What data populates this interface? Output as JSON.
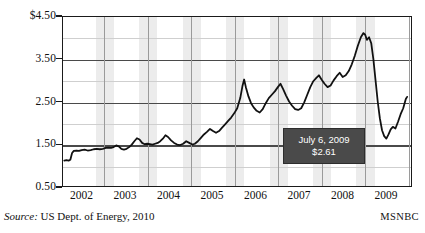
{
  "figure": {
    "source_label": "Source:",
    "source_text": " US Dept. of Energy, 2010",
    "attribution": "MSNBC"
  },
  "callout": {
    "date": "July 6, 2009",
    "value": "$2.61"
  },
  "colors": {
    "line": "#111111",
    "band": "#ececec",
    "grid_major": "#4a4a4a",
    "grid_minor": "#cfcfcf",
    "frame": "#1a1a1a",
    "callout_bg": "#4a4a4a",
    "callout_text": "#ffffff"
  },
  "chart_data": {
    "type": "line",
    "title": "",
    "subtitle": "",
    "xlabel": "",
    "ylabel": "",
    "ylim": [
      0.5,
      4.5
    ],
    "xlim": [
      2001.55,
      2009.6
    ],
    "grid": true,
    "legend": null,
    "y_ticks": [
      "0.50",
      "1.50",
      "2.50",
      "3.50",
      "$4.50"
    ],
    "y_tick_values": [
      0.5,
      1.5,
      2.5,
      3.5,
      4.5
    ],
    "y_minor_gridlines": [
      1.0,
      2.0,
      3.0,
      4.0
    ],
    "x_ticks": [
      "2002",
      "2003",
      "2004",
      "2005",
      "2006",
      "2007",
      "2008",
      "2009"
    ],
    "x_tick_values": [
      2002,
      2003,
      2004,
      2005,
      2006,
      2007,
      2008,
      2009
    ],
    "shaded_bands": [
      [
        2002.3,
        2002.72
      ],
      [
        2003.3,
        2003.72
      ],
      [
        2004.3,
        2004.72
      ],
      [
        2005.3,
        2005.72
      ],
      [
        2006.3,
        2006.72
      ],
      [
        2007.3,
        2007.72
      ],
      [
        2008.3,
        2008.72
      ]
    ],
    "annotations": [
      {
        "label": "July 6, 2009",
        "value": 2.61,
        "x": 2009.51
      }
    ],
    "series": [
      {
        "name": "US average retail gasoline price ($/gallon)",
        "x": [
          2001.58,
          2001.63,
          2001.68,
          2001.72,
          2001.76,
          2001.8,
          2001.86,
          2001.92,
          2001.98,
          2002.05,
          2002.12,
          2002.19,
          2002.26,
          2002.33,
          2002.4,
          2002.47,
          2002.54,
          2002.6,
          2002.66,
          2002.72,
          2002.78,
          2002.84,
          2002.9,
          2002.96,
          2003.02,
          2003.08,
          2003.14,
          2003.2,
          2003.26,
          2003.32,
          2003.38,
          2003.44,
          2003.5,
          2003.56,
          2003.62,
          2003.68,
          2003.74,
          2003.8,
          2003.86,
          2003.92,
          2003.98,
          2004.05,
          2004.12,
          2004.19,
          2004.26,
          2004.33,
          2004.4,
          2004.47,
          2004.54,
          2004.6,
          2004.67,
          2004.74,
          2004.81,
          2004.88,
          2004.95,
          2005.02,
          2005.09,
          2005.16,
          2005.23,
          2005.3,
          2005.37,
          2005.44,
          2005.51,
          2005.58,
          2005.65,
          2005.7,
          2005.74,
          2005.78,
          2005.84,
          2005.9,
          2005.96,
          2006.03,
          2006.1,
          2006.17,
          2006.24,
          2006.31,
          2006.38,
          2006.45,
          2006.52,
          2006.58,
          2006.64,
          2006.71,
          2006.78,
          2006.85,
          2006.92,
          2006.99,
          2007.06,
          2007.13,
          2007.2,
          2007.27,
          2007.34,
          2007.41,
          2007.47,
          2007.53,
          2007.6,
          2007.67,
          2007.74,
          2007.81,
          2007.88,
          2007.95,
          2008.02,
          2008.09,
          2008.16,
          2008.23,
          2008.3,
          2008.37,
          2008.44,
          2008.5,
          2008.54,
          2008.58,
          2008.63,
          2008.68,
          2008.73,
          2008.78,
          2008.83,
          2008.88,
          2008.93,
          2008.98,
          2009.03,
          2009.08,
          2009.13,
          2009.18,
          2009.24,
          2009.3,
          2009.36,
          2009.42,
          2009.48,
          2009.51
        ],
        "y": [
          1.1,
          1.11,
          1.1,
          1.12,
          1.28,
          1.33,
          1.34,
          1.33,
          1.35,
          1.36,
          1.34,
          1.35,
          1.37,
          1.38,
          1.37,
          1.38,
          1.4,
          1.41,
          1.4,
          1.42,
          1.46,
          1.44,
          1.38,
          1.36,
          1.38,
          1.42,
          1.48,
          1.56,
          1.63,
          1.6,
          1.52,
          1.49,
          1.5,
          1.49,
          1.48,
          1.5,
          1.52,
          1.56,
          1.62,
          1.7,
          1.66,
          1.58,
          1.52,
          1.48,
          1.47,
          1.5,
          1.56,
          1.52,
          1.48,
          1.5,
          1.56,
          1.64,
          1.72,
          1.78,
          1.85,
          1.8,
          1.76,
          1.8,
          1.88,
          1.96,
          2.04,
          2.12,
          2.22,
          2.34,
          2.58,
          2.86,
          3.02,
          2.84,
          2.62,
          2.46,
          2.36,
          2.28,
          2.24,
          2.32,
          2.46,
          2.58,
          2.66,
          2.74,
          2.84,
          2.92,
          2.8,
          2.64,
          2.5,
          2.4,
          2.32,
          2.3,
          2.34,
          2.48,
          2.66,
          2.84,
          2.98,
          3.06,
          3.12,
          3.02,
          2.92,
          2.84,
          2.88,
          3.0,
          3.1,
          3.18,
          3.08,
          3.12,
          3.22,
          3.38,
          3.58,
          3.82,
          4.02,
          4.12,
          4.08,
          3.96,
          4.02,
          3.88,
          3.5,
          3.0,
          2.5,
          2.1,
          1.82,
          1.68,
          1.62,
          1.72,
          1.84,
          1.9,
          1.86,
          2.02,
          2.2,
          2.34,
          2.56,
          2.61
        ]
      }
    ]
  }
}
